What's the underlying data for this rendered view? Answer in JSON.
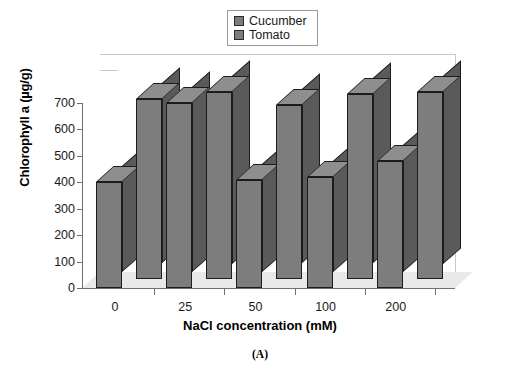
{
  "figure": {
    "caption": "(A)"
  },
  "legend": {
    "position": "top-center",
    "entries": [
      {
        "label": "Cucumber",
        "color": "#7d7d7d"
      },
      {
        "label": "Tomato",
        "color": "#7d7d7d"
      }
    ]
  },
  "chart_data": {
    "type": "bar",
    "style": "3d-grouped-column",
    "title": "",
    "xlabel": "NaCl concentration (mM)",
    "ylabel": "Chlorophyll a (µg/g)",
    "categories": [
      "0",
      "25",
      "50",
      "100",
      "200"
    ],
    "series": [
      {
        "name": "Cucumber",
        "color": "#7d7d7d",
        "values": [
          400,
          700,
          410,
          420,
          480
        ]
      },
      {
        "name": "Tomato",
        "color": "#7d7d7d",
        "values": [
          680,
          710,
          660,
          700,
          710
        ]
      }
    ],
    "ylim": [
      0,
      700
    ],
    "yticks": [
      0,
      100,
      200,
      300,
      400,
      500,
      600,
      700
    ],
    "ytick_labels": [
      "0",
      "100",
      "200",
      "300",
      "400",
      "500",
      "600",
      "700"
    ],
    "grid": false,
    "legend_position": "top-center"
  },
  "colors": {
    "bar_front": "#7d7d7d",
    "bar_side": "#5a5a5a",
    "bar_top": "#8e8e8e",
    "bar_edge": "#1c1c1c",
    "floor": "#e9e9e9",
    "wall": "#c9c9c9",
    "axis": "#6f6f6f",
    "background": "#ffffff"
  }
}
